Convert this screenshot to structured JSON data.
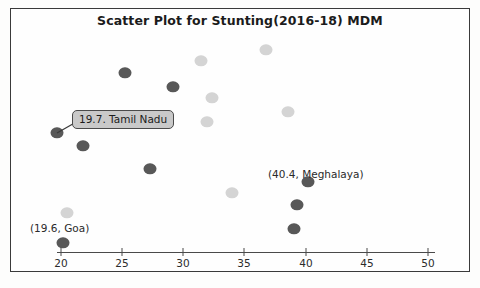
{
  "chart_data": {
    "type": "scatter",
    "title": "Scatter Plot for Stunting(2016-18) MDM",
    "xlabel": "",
    "ylabel": "",
    "xlim": [
      18,
      51
    ],
    "ylim": [
      0,
      10
    ],
    "grid": false,
    "legend": "none",
    "xticks": [
      20,
      25,
      30,
      35,
      40,
      45,
      50
    ],
    "series": [
      {
        "name": "dark-series",
        "color": "#585858",
        "points": [
          {
            "x": 25.2,
            "y": 8.3
          },
          {
            "x": 29.2,
            "y": 7.6
          },
          {
            "x": 19.7,
            "y": 5.4,
            "label": "19.7. Tamil Nadu"
          },
          {
            "x": 21.8,
            "y": 4.8
          },
          {
            "x": 27.3,
            "y": 3.8
          },
          {
            "x": 40.4,
            "y": 3.2,
            "label": "(40.4, Meghalaya)"
          },
          {
            "x": 39.4,
            "y": 2.1
          },
          {
            "x": 39.1,
            "y": 1.0
          },
          {
            "x": 19.6,
            "y": 0.4,
            "label": "(19.6, Goa)"
          }
        ]
      },
      {
        "name": "light-series",
        "color": "#d4d4d4",
        "points": [
          {
            "x": 36.8,
            "y": 9.4
          },
          {
            "x": 31.5,
            "y": 8.9
          },
          {
            "x": 32.4,
            "y": 7.1
          },
          {
            "x": 38.6,
            "y": 6.4
          },
          {
            "x": 32.0,
            "y": 5.9
          },
          {
            "x": 34.0,
            "y": 2.6
          },
          {
            "x": 20.5,
            "y": 1.7
          }
        ]
      }
    ],
    "annotations": [
      {
        "name": "tamil-nadu",
        "text": "19.7. Tamil Nadu",
        "boxed": true
      },
      {
        "name": "meghalaya",
        "text": "(40.4, Meghalaya)",
        "boxed": false
      },
      {
        "name": "goa",
        "text": "(19.6, Goa)",
        "boxed": false
      }
    ]
  },
  "pixel_layout": {
    "dark_points": [
      {
        "cx": 125,
        "cy": 73,
        "r": 6.5
      },
      {
        "cx": 173,
        "cy": 87,
        "r": 6.5
      },
      {
        "cx": 57,
        "cy": 133,
        "r": 6.5
      },
      {
        "cx": 83,
        "cy": 146,
        "r": 6.5
      },
      {
        "cx": 150,
        "cy": 169,
        "r": 6.5
      },
      {
        "cx": 308,
        "cy": 182,
        "r": 6.5
      },
      {
        "cx": 297,
        "cy": 205,
        "r": 6.5
      },
      {
        "cx": 294,
        "cy": 229,
        "r": 6.5
      },
      {
        "cx": 63,
        "cy": 243,
        "r": 6.5
      }
    ],
    "light_points": [
      {
        "cx": 266,
        "cy": 50,
        "r": 6.5
      },
      {
        "cx": 201,
        "cy": 61,
        "r": 6.5
      },
      {
        "cx": 212,
        "cy": 98,
        "r": 6.5
      },
      {
        "cx": 288,
        "cy": 112,
        "r": 6.5
      },
      {
        "cx": 207,
        "cy": 122,
        "r": 6.5
      },
      {
        "cx": 232,
        "cy": 193,
        "r": 6.5
      },
      {
        "cx": 67,
        "cy": 213,
        "r": 6.5
      }
    ],
    "tick_px": [
      61,
      122,
      183,
      244,
      306,
      367,
      428
    ]
  },
  "colors": {
    "dark_marker": "#585858",
    "light_marker": "#d4d4d4",
    "frame": "#3a3a3a",
    "axis": "#4a4a4a",
    "callout_fill": "#c9c9c9",
    "text": "#1b1b1b"
  }
}
